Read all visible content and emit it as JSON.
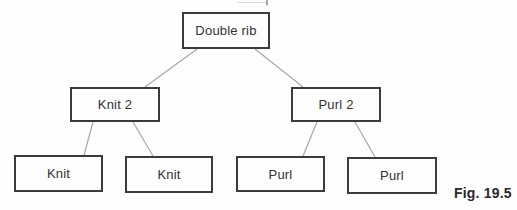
{
  "figure_caption": "Fig. 19.5",
  "diagram": {
    "type": "tree",
    "nodes": [
      {
        "id": "double-rib",
        "label": "Double rib",
        "level": 0
      },
      {
        "id": "knit-2",
        "label": "Knit 2",
        "level": 1
      },
      {
        "id": "purl-2",
        "label": "Purl 2",
        "level": 1
      },
      {
        "id": "knit-a",
        "label": "Knit",
        "level": 2
      },
      {
        "id": "knit-b",
        "label": "Knit",
        "level": 2
      },
      {
        "id": "purl-a",
        "label": "Purl",
        "level": 2
      },
      {
        "id": "purl-b",
        "label": "Purl",
        "level": 2
      }
    ],
    "edges": [
      {
        "from": "double-rib",
        "to": "knit-2"
      },
      {
        "from": "double-rib",
        "to": "purl-2"
      },
      {
        "from": "knit-2",
        "to": "knit-a"
      },
      {
        "from": "knit-2",
        "to": "knit-b"
      },
      {
        "from": "purl-2",
        "to": "purl-a"
      },
      {
        "from": "purl-2",
        "to": "purl-b"
      }
    ]
  },
  "colors": {
    "background": "#fdfdfd",
    "box_border": "#3b3b3b",
    "connector_line": "#a8a8a8",
    "text": "#333333",
    "caption_text": "#2a2a2a"
  }
}
